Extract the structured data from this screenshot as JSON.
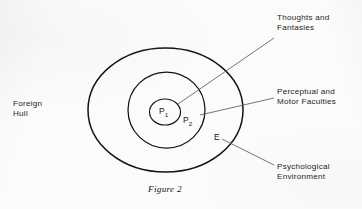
{
  "figure": {
    "caption": "Figure 2",
    "background_color": "#fbfbfb",
    "ink_color": "#141414",
    "leader_color": "#5c5c5c"
  },
  "labels": {
    "foreign_hull": "Foreign\nHull",
    "thoughts": "Thoughts and\nFantasies",
    "perceptual": "Perceptual and\nMotor Faculties",
    "psychological_environment": "Psychological\nEnvironment"
  },
  "markers": {
    "p1": "P",
    "p1_sub": "1",
    "p2": "P",
    "p2_sub": "2",
    "e": "E"
  },
  "diagram": {
    "type": "nested-ellipse-venn",
    "shapes": [
      {
        "name": "outer-ellipse-psychological-environment",
        "cx": 165.5,
        "cy": 110,
        "rx": 77.5,
        "ry": 62,
        "stroke_width": 1.5,
        "denotes": "Psychological Environment"
      },
      {
        "name": "middle-ellipse-perceptual-motor-faculties",
        "cx": 166.5,
        "cy": 110,
        "rx": 38.5,
        "ry": 38,
        "stroke_width": 1.25,
        "denotes": "Perceptual and Motor Faculties"
      },
      {
        "name": "inner-circle-thoughts-fantasies",
        "cx": 165,
        "cy": 112,
        "rx": 15.5,
        "ry": 13,
        "stroke_width": 1.15,
        "denotes": "Thoughts and Fantasies"
      }
    ],
    "leaders": [
      {
        "name": "leader-thoughts",
        "x1": 274,
        "y1": 38,
        "x2": 178,
        "y2": 104
      },
      {
        "name": "leader-perceptual",
        "x1": 274,
        "y1": 98,
        "x2": 200,
        "y2": 115
      },
      {
        "name": "leader-psych-env",
        "x1": 274,
        "y1": 165,
        "x2": 222,
        "y2": 139
      }
    ]
  }
}
